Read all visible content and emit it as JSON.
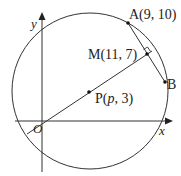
{
  "diagram": {
    "type": "coordinate-geometry",
    "axes": {
      "x_label": "x",
      "y_label": "y",
      "origin_label": "O"
    },
    "points": [
      {
        "id": "A",
        "label": "A(9, 10)",
        "name": "A",
        "coords": "(9, 10)"
      },
      {
        "id": "M",
        "label": "M(11, 7)",
        "name": "M",
        "coords": "(11, 7)"
      },
      {
        "id": "B",
        "label": "B",
        "name": "B"
      },
      {
        "id": "P",
        "label_prefix": "P(",
        "label_var": "p",
        "label_suffix": ", 3)"
      }
    ],
    "elements": {
      "circle": "circle centred at P through A and B",
      "chord": "AB",
      "line": "line through O, P and M",
      "right_angle": "at M between OM and AB"
    },
    "colors": {
      "stroke": "#333333",
      "text": "#222222",
      "background": "#ffffff"
    }
  }
}
